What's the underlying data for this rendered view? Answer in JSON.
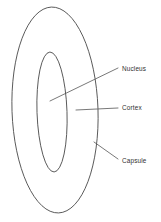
{
  "diagram": {
    "background_color": "#ffffff",
    "stroke_color": "#4a4a4a",
    "leader_color": "#555555",
    "text_color": "#2f2f2f",
    "shapes": [
      {
        "name": "capsule-outer-ellipse",
        "label_ref": "capsule",
        "cx": 55,
        "cy": 110,
        "rx": 43,
        "ry": 103,
        "rotation": -2
      },
      {
        "name": "nucleus-inner-ellipse",
        "label_ref": "nucleus",
        "cx": 52,
        "cy": 112,
        "rx": 15,
        "ry": 60,
        "rotation": -2
      }
    ],
    "labels": [
      {
        "id": "nucleus",
        "text": "Nucleus",
        "text_x": 122,
        "text_y": 69,
        "leader": {
          "x1": 50,
          "y1": 101,
          "x2": 118,
          "y2": 68
        }
      },
      {
        "id": "cortex",
        "text": "Cortex",
        "text_x": 122,
        "text_y": 108,
        "leader": {
          "x1": 76,
          "y1": 110,
          "x2": 118,
          "y2": 108
        }
      },
      {
        "id": "capsule",
        "text": "Capsule",
        "text_x": 122,
        "text_y": 161,
        "leader": {
          "x1": 94,
          "y1": 142,
          "x2": 118,
          "y2": 159
        }
      }
    ]
  }
}
